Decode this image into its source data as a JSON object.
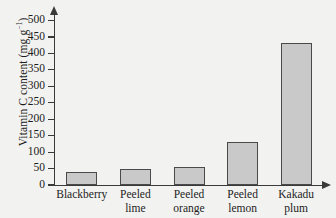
{
  "chart_data": {
    "type": "bar",
    "title": "",
    "xlabel": "",
    "ylabel": "Vitamin C content (mg g⁻¹)",
    "ylabel_parts": {
      "main": "Vitamin C content (mg g",
      "exponent": "−1",
      "tail": ")"
    },
    "categories": [
      "Blackberry",
      "Peeled lime",
      "Peeled orange",
      "Peeled lemon",
      "Kakadu plum"
    ],
    "category_lines": [
      [
        "Blackberry"
      ],
      [
        "Peeled",
        "lime"
      ],
      [
        "Peeled",
        "orange"
      ],
      [
        "Peeled",
        "lemon"
      ],
      [
        "Kakadu",
        "plum"
      ]
    ],
    "values": [
      40,
      48,
      55,
      131,
      433
    ],
    "ylim": [
      0,
      520
    ],
    "yticks": [
      0,
      50,
      100,
      150,
      200,
      250,
      300,
      350,
      400,
      450,
      500
    ],
    "ytick_labels": [
      "0",
      "50",
      "100",
      "150",
      "200",
      "250",
      "300",
      "350",
      "400",
      "450",
      "500"
    ],
    "grid": false,
    "legend": null,
    "bar_color": "#c9c9c9",
    "bar_edge_color": "#4a4a4a",
    "axis_color": "#3a3a3a",
    "background_color": "#f2f2f0"
  }
}
